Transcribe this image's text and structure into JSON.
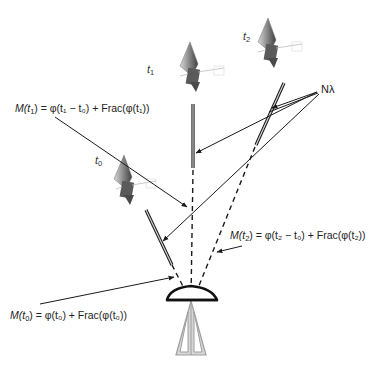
{
  "diagram": {
    "satellites": [
      {
        "id": "t0",
        "label_base": "t",
        "label_sub": "0"
      },
      {
        "id": "t1",
        "label_base": "t",
        "label_sub": "1"
      },
      {
        "id": "t2",
        "label_base": "t",
        "label_sub": "2"
      }
    ],
    "ambiguity_label": "Nλ",
    "equations": {
      "m_t1": {
        "lhs": "M(",
        "lhs_var": "t",
        "lhs_sub": "1",
        "rhs": ") = φ(t₁ − t₀) + Frac(φ(t₁))"
      },
      "m_t2": {
        "lhs": "M(",
        "lhs_var": "t",
        "lhs_sub": "2",
        "rhs": ") =  φ(t₂ − t₀) + Frac(φ(t₂))"
      },
      "m_t0": {
        "lhs": "M(",
        "lhs_var": "t",
        "lhs_sub": "0",
        "rhs": ") = φ(t₀) + Frac(φ(t₀))"
      }
    },
    "colors": {
      "line": "#1a1a1a",
      "bar_fill": "#bdbdbd",
      "tripod": "#9e9e9e",
      "satellite_panel": "#6b6b6b",
      "satellite_body": "#555555"
    }
  }
}
